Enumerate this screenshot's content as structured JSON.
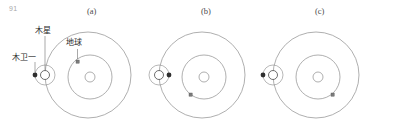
{
  "page": {
    "number": "91"
  },
  "figure": {
    "panels": [
      {
        "caption": "(a)",
        "center_x": 88,
        "jupiter_orbit_r": 43,
        "earth_orbit_r": 22,
        "sun_r": 5,
        "jupiter_x": 45,
        "jupiter_r": 4.5,
        "io_orbit_r": 10,
        "io_angle_deg": 180,
        "io_r": 2.4,
        "earth_angle_deg": 235,
        "earth_size": 3
      },
      {
        "caption": "(b)",
        "center_x": 202,
        "jupiter_orbit_r": 43,
        "earth_orbit_r": 22,
        "sun_r": 5,
        "jupiter_x": 159,
        "jupiter_r": 4.5,
        "io_orbit_r": 10,
        "io_angle_deg": 0,
        "io_r": 2.4,
        "earth_angle_deg": 125,
        "earth_size": 3
      },
      {
        "caption": "(c)",
        "center_x": 316,
        "jupiter_orbit_r": 43,
        "earth_orbit_r": 22,
        "sun_r": 5,
        "jupiter_x": 273,
        "jupiter_r": 4.5,
        "io_orbit_r": 10,
        "io_angle_deg": 180,
        "io_r": 2.4,
        "earth_angle_deg": 55,
        "earth_size": 3
      }
    ],
    "center_y": 75,
    "labels": {
      "jupiter": "木星",
      "io": "木卫一",
      "earth": "地球"
    },
    "colors": {
      "orbit_stroke": "#8c8c8c",
      "body_stroke": "#5a5a5a",
      "body_fill": "#3a3a3a",
      "leader_line": "#6e6e6e",
      "label_text": "#2d2d2d",
      "caption_text": "#4a4a4a",
      "page_number_text": "#a8a8a8",
      "background": "#ffffff"
    }
  }
}
